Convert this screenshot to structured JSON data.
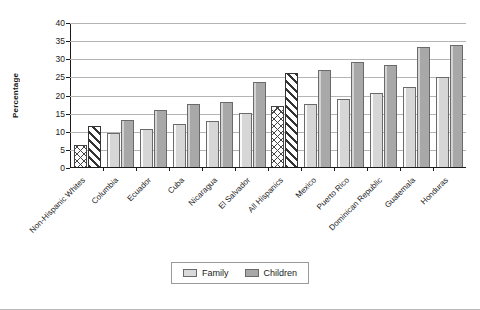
{
  "chart_data": {
    "type": "bar",
    "title": "",
    "xlabel": "",
    "ylabel": "Percentage",
    "ylim": [
      0,
      40
    ],
    "yticks": [
      0,
      5,
      10,
      15,
      20,
      25,
      30,
      35,
      40
    ],
    "grid": true,
    "legend_position": "bottom",
    "categories": [
      "Non-Hispanic Whites",
      "Columbia",
      "Ecuador",
      "Cuba",
      "Nicaragua",
      "El Salvador",
      "All Hispanics",
      "Mexico",
      "Puerto Rico",
      "Dominican Republic",
      "Guatemala",
      "Honduras"
    ],
    "highlighted_categories": [
      "Non-Hispanic Whites",
      "All Hispanics"
    ],
    "series": [
      {
        "name": "Family",
        "color": "#d6d6d6",
        "values": [
          6.0,
          9.3,
          10.5,
          12.0,
          12.7,
          15.0,
          16.8,
          17.4,
          18.7,
          20.3,
          22.2,
          24.7
        ]
      },
      {
        "name": "Children",
        "color": "#a8a8a8",
        "values": [
          11.4,
          13.0,
          15.6,
          17.3,
          17.9,
          23.4,
          26.0,
          26.8,
          28.9,
          28.2,
          33.0,
          33.7
        ]
      }
    ]
  }
}
